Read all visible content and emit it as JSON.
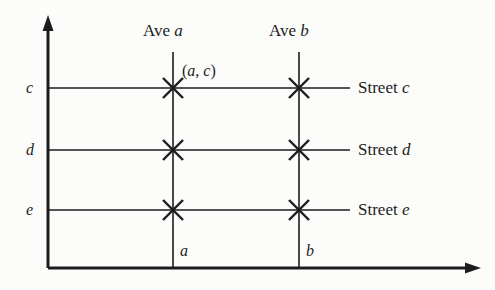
{
  "figure": {
    "background_color": "#fcfcfa",
    "ink_color": "#1c1c1c"
  },
  "axes": {
    "y_axis": {
      "name": "vertical-axis",
      "x": 48,
      "y_top": 18,
      "y_bottom": 268,
      "arrow": "up"
    },
    "x_axis": {
      "name": "horizontal-axis",
      "y": 268,
      "x_left": 48,
      "x_right": 481,
      "arrow": "right"
    }
  },
  "avenues": [
    {
      "id": "a",
      "label": "Ave",
      "italic_name": "a",
      "x": 173,
      "y_top": 52,
      "y_bottom": 268,
      "bottom_label": "a"
    },
    {
      "id": "b",
      "label": "Ave",
      "italic_name": "b",
      "x": 299,
      "y_top": 52,
      "y_bottom": 268,
      "bottom_label": "b"
    }
  ],
  "streets": [
    {
      "id": "c",
      "label": "Street",
      "italic_name": "c",
      "y": 88,
      "x_left": 48,
      "x_right": 350,
      "axis_tick_label": "c"
    },
    {
      "id": "d",
      "label": "Street",
      "italic_name": "d",
      "y": 150,
      "x_left": 48,
      "x_right": 350,
      "axis_tick_label": "d"
    },
    {
      "id": "e",
      "label": "Street",
      "italic_name": "e",
      "y": 210,
      "x_left": 48,
      "x_right": 350,
      "axis_tick_label": "e"
    }
  ],
  "intersections": [
    {
      "avenue": "a",
      "street": "c",
      "x": 173,
      "y": 88
    },
    {
      "avenue": "b",
      "street": "c",
      "x": 299,
      "y": 88
    },
    {
      "avenue": "a",
      "street": "d",
      "x": 173,
      "y": 150
    },
    {
      "avenue": "b",
      "street": "d",
      "x": 299,
      "y": 150
    },
    {
      "avenue": "a",
      "street": "e",
      "x": 173,
      "y": 210
    },
    {
      "avenue": "b",
      "street": "e",
      "x": 299,
      "y": 210
    }
  ],
  "point_annotation": {
    "text_open": "(",
    "first": "a",
    "separator": ", ",
    "second": "c",
    "text_close": ")",
    "full_text": "(a, c)",
    "x": 182,
    "y": 63
  },
  "labels": {
    "ave_a": {
      "prefix": "Ave",
      "name": "a",
      "x": 143,
      "y": 22
    },
    "ave_b": {
      "prefix": "Ave",
      "name": "b",
      "x": 269,
      "y": 22
    },
    "street_c": {
      "prefix": "Street",
      "name": "c",
      "x": 358,
      "y": 79
    },
    "street_d": {
      "prefix": "Street",
      "name": "d",
      "x": 358,
      "y": 141
    },
    "street_e": {
      "prefix": "Street",
      "name": "e",
      "x": 358,
      "y": 201
    },
    "tick_c": {
      "text": "c",
      "x": 26,
      "y": 80
    },
    "tick_d": {
      "text": "d",
      "x": 26,
      "y": 142
    },
    "tick_e": {
      "text": "e",
      "x": 26,
      "y": 202
    },
    "bottom_a": {
      "text": "a",
      "x": 180,
      "y": 243
    },
    "bottom_b": {
      "text": "b",
      "x": 306,
      "y": 243
    }
  }
}
